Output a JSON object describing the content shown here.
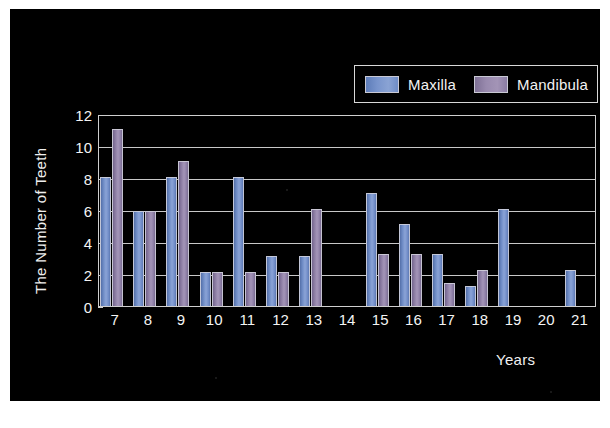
{
  "chart_data": {
    "type": "bar",
    "title": "",
    "xlabel": "Years",
    "ylabel": "The Number of Teeth",
    "categories": [
      "7",
      "8",
      "9",
      "10",
      "11",
      "12",
      "13",
      "14",
      "15",
      "16",
      "17",
      "18",
      "19",
      "20",
      "21"
    ],
    "series": [
      {
        "name": "Maxilla",
        "color": "#6f8cc6",
        "values": [
          8.1,
          6.0,
          8.1,
          2.2,
          8.1,
          3.2,
          3.2,
          0,
          7.1,
          5.2,
          3.3,
          1.3,
          6.1,
          0,
          2.3
        ]
      },
      {
        "name": "Mandibula",
        "color": "#8d7ea4",
        "values": [
          11.1,
          6.0,
          9.1,
          2.2,
          2.2,
          2.2,
          6.1,
          0,
          3.3,
          3.3,
          1.5,
          2.3,
          0,
          0,
          0
        ]
      }
    ],
    "ylim": [
      0,
      12
    ],
    "yticks": [
      0,
      2,
      4,
      6,
      8,
      10,
      12
    ],
    "grid": true,
    "legend_position": "top-right"
  },
  "legend": {
    "entries": [
      {
        "label": "Maxilla",
        "swatch": "maxilla-swatch"
      },
      {
        "label": "Mandibula",
        "swatch": "mandibula-swatch"
      }
    ]
  },
  "axes": {
    "y_title": "The Number of Teeth",
    "x_title": "Years"
  },
  "colors": {
    "background": "#000000",
    "page": "#ffffff",
    "text": "#f4f4f4",
    "grid": "#c8c8c8",
    "maxilla": "#6f8cc6",
    "mandibula": "#8d7ea4"
  }
}
